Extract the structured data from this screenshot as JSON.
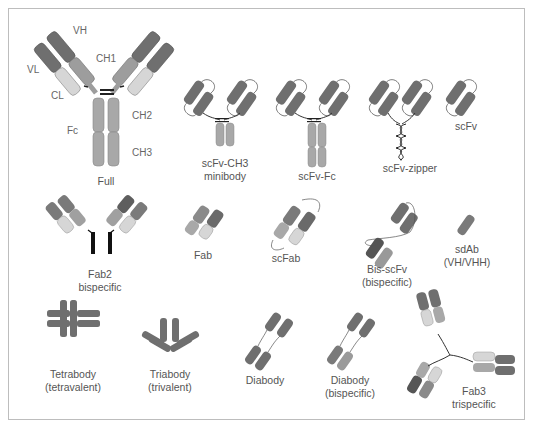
{
  "colors": {
    "variable_dark": "#6f6f6f",
    "variable_darker": "#5a5a5a",
    "constant_mid": "#9a9a9a",
    "constant_light": "#d4d4d4",
    "fc": "#a8a8a8",
    "linker": "#333333",
    "frame_border": "#bdbdbd",
    "text": "#555555"
  },
  "domain_labels": {
    "vh": "VH",
    "vl": "VL",
    "ch1": "CH1",
    "cl": "CL",
    "ch2": "CH2",
    "ch3": "CH3",
    "fc": "Fc"
  },
  "formats": [
    {
      "id": "full",
      "label": "Full"
    },
    {
      "id": "scfv-ch3",
      "label_line1": "scFv-CH3",
      "label_line2": "minibody"
    },
    {
      "id": "scfv-fc",
      "label": "scFv-Fc"
    },
    {
      "id": "scfv-zipper",
      "label": "scFv-zipper"
    },
    {
      "id": "scfv",
      "label": "scFv"
    },
    {
      "id": "fab2",
      "label_line1": "Fab2",
      "label_line2": "bispecific"
    },
    {
      "id": "fab",
      "label": "Fab"
    },
    {
      "id": "scfab",
      "label": "scFab"
    },
    {
      "id": "bis-scfv",
      "label_line1": "Bis-scFv",
      "label_line2": "(bispecific)"
    },
    {
      "id": "sdab",
      "label_line1": "sdAb",
      "label_line2": "(VH/VHH)"
    },
    {
      "id": "tetrabody",
      "label_line1": "Tetrabody",
      "label_line2": "(tetravalent)"
    },
    {
      "id": "triabody",
      "label_line1": "Triabody",
      "label_line2": "(trivalent)"
    },
    {
      "id": "diabody",
      "label": "Diabody"
    },
    {
      "id": "diabody-bispecific",
      "label_line1": "Diabody",
      "label_line2": "(bispecific)"
    },
    {
      "id": "fab3",
      "label_line1": "Fab3",
      "label_line2": "trispecific"
    }
  ]
}
